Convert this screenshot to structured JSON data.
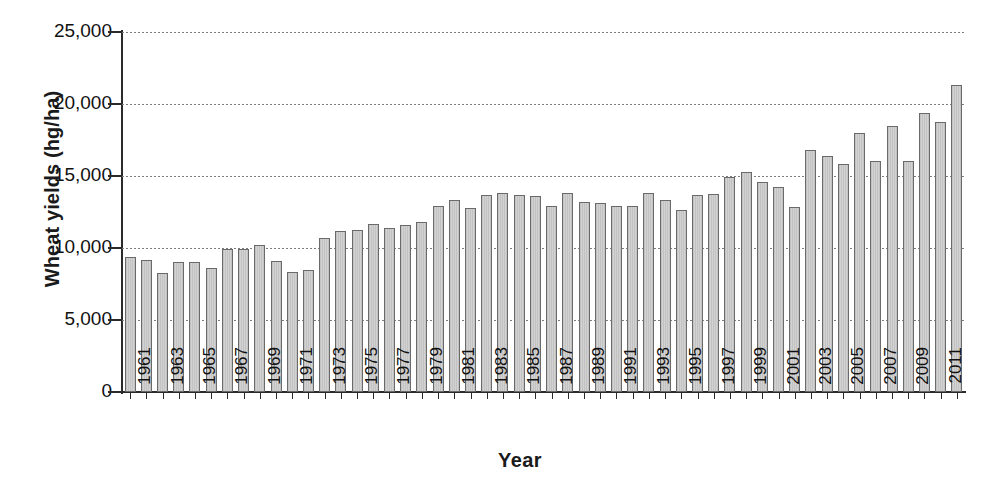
{
  "chart_data": {
    "type": "bar",
    "title": "",
    "xlabel": "Year",
    "ylabel": "Wheat yields (hg/ha)",
    "ylim": [
      0,
      25000
    ],
    "yticks": [
      0,
      5000,
      10000,
      15000,
      20000,
      25000
    ],
    "ytick_labels": [
      "0",
      "5,000",
      "10,000",
      "15,000",
      "20,000",
      "25,000"
    ],
    "grid": "horizontal-dotted",
    "legend": "none",
    "bar_color": "#c9c9c9",
    "bar_border_color": "#6a6a6a",
    "axis_color": "#2a2a2a",
    "categories": [
      "1961",
      "1962",
      "1963",
      "1964",
      "1965",
      "1966",
      "1967",
      "1968",
      "1969",
      "1970",
      "1971",
      "1972",
      "1973",
      "1974",
      "1975",
      "1976",
      "1977",
      "1978",
      "1979",
      "1980",
      "1981",
      "1982",
      "1983",
      "1984",
      "1985",
      "1986",
      "1987",
      "1988",
      "1989",
      "1990",
      "1991",
      "1992",
      "1993",
      "1994",
      "1995",
      "1996",
      "1997",
      "1998",
      "1999",
      "2000",
      "2001",
      "2002",
      "2003",
      "2004",
      "2005",
      "2006",
      "2007",
      "2008",
      "2009",
      "2010",
      "2011",
      "2012"
    ],
    "xtick_labels_shown": [
      "1961",
      "1963",
      "1965",
      "1967",
      "1969",
      "1971",
      "1973",
      "1975",
      "1977",
      "1979",
      "1981",
      "1983",
      "1985",
      "1987",
      "1989",
      "1991",
      "1993",
      "1995",
      "1997",
      "1999",
      "2001",
      "2003",
      "2005",
      "2007",
      "2009",
      "2011"
    ],
    "values": [
      9350,
      9150,
      8250,
      9000,
      9000,
      8600,
      9950,
      9950,
      10200,
      9100,
      8300,
      8450,
      10700,
      11150,
      11250,
      11650,
      11400,
      11600,
      11800,
      12900,
      13300,
      12800,
      13700,
      13800,
      13650,
      13600,
      12950,
      13800,
      13200,
      13100,
      12900,
      12900,
      13800,
      13300,
      12650,
      13650,
      13750,
      14900,
      15250,
      14550,
      14250,
      12850,
      16800,
      16400,
      15800,
      18000,
      16050,
      18500,
      16050,
      19350,
      18750,
      21300
    ]
  }
}
